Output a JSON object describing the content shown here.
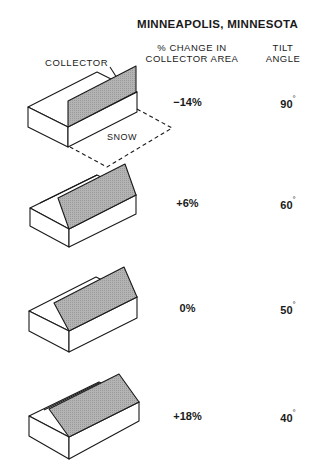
{
  "title": "MINNEAPOLIS, MINNESOTA",
  "headers": {
    "change_line1": "% CHANGE IN",
    "change_line2": "COLLECTOR  AREA",
    "tilt_line1": "TILT",
    "tilt_line2": "ANGLE"
  },
  "labels": {
    "collector": "COLLECTOR",
    "snow": "SNOW"
  },
  "rows": [
    {
      "change": "−14%",
      "angle": "90",
      "degree": "°"
    },
    {
      "change": "+6%",
      "angle": "60",
      "degree": "°"
    },
    {
      "change": "0%",
      "angle": "50",
      "degree": "°"
    },
    {
      "change": "+18%",
      "angle": "40",
      "degree": "°"
    }
  ],
  "colors": {
    "collector_fill": "#a8a8a8",
    "line": "#1a1a1a"
  }
}
